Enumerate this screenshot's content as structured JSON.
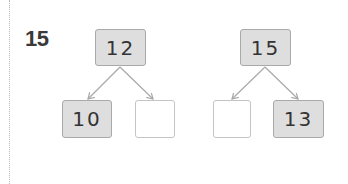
{
  "problem": {
    "number": "15",
    "trees": [
      {
        "top": "12",
        "left": "10",
        "right": ""
      },
      {
        "top": "15",
        "left": "",
        "right": "13"
      }
    ]
  },
  "colors": {
    "filled_box": "#dedede",
    "box_border": "#b9b9b9",
    "arrow": "#a8a8a8",
    "text": "#333333"
  }
}
